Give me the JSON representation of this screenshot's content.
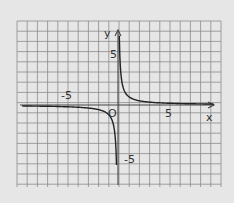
{
  "chart_data": {
    "type": "line",
    "title": "",
    "function": "y = 1/x",
    "xlabel": "x",
    "ylabel": "y",
    "origin_label": "O",
    "tick_labels": {
      "x": [
        "-5",
        "5"
      ],
      "y": [
        "5",
        "-5"
      ]
    },
    "xlim": [
      -10,
      10
    ],
    "ylim": [
      -8,
      8
    ],
    "grid": true,
    "series": [
      {
        "name": "branch-positive",
        "x": [
          0.2,
          0.3,
          0.5,
          1,
          2,
          3,
          5,
          10
        ],
        "y": [
          5,
          3.33,
          2,
          1,
          0.5,
          0.33,
          0.2,
          0.1
        ]
      },
      {
        "name": "branch-negative",
        "x": [
          -10,
          -5,
          -3,
          -2,
          -1,
          -0.5,
          -0.3,
          -0.2
        ],
        "y": [
          -0.1,
          -0.2,
          -0.33,
          -0.5,
          -1,
          -2,
          -3.33,
          -5
        ]
      }
    ]
  },
  "labels": {
    "y_axis": "y",
    "x_axis": "x",
    "origin": "O",
    "x_neg5": "-5",
    "x_pos5": "5",
    "y_pos5": "5",
    "y_neg5": "-5"
  }
}
